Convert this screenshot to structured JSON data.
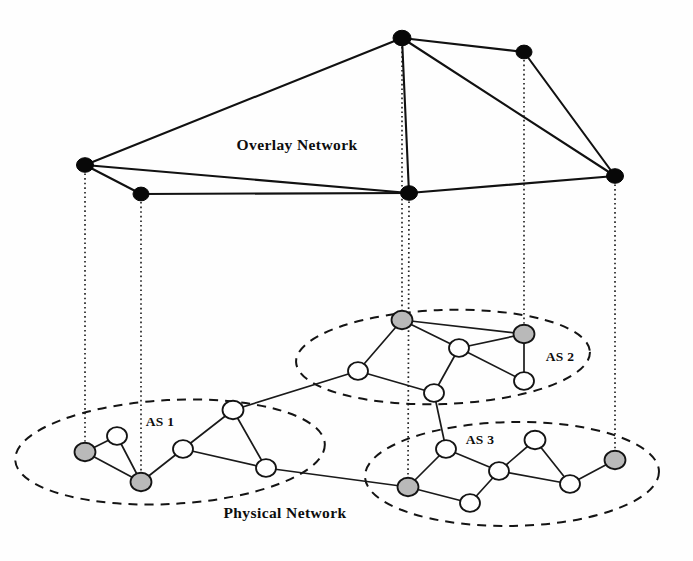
{
  "figure": {
    "labels": {
      "overlay": "Overlay Network",
      "physical": "Physical Network",
      "as1": "AS 1",
      "as2": "AS 2",
      "as3": "AS 3"
    },
    "colors": {
      "overlay_node_fill": "#080808",
      "physical_node_fill": "#ffffff",
      "gateway_node_fill": "#b9b9b9",
      "stroke": "#141414",
      "background": "#ffffff"
    }
  },
  "chart_data": {
    "type": "diagram",
    "layers": [
      {
        "name": "Overlay Network",
        "label_pos": {
          "x": 297,
          "y": 150
        },
        "nodes": [
          {
            "id": "o1",
            "x": 85,
            "y": 165,
            "r": 8.5,
            "style": "filled"
          },
          {
            "id": "o2",
            "x": 141,
            "y": 194,
            "r": 8.0,
            "style": "filled"
          },
          {
            "id": "o3",
            "x": 402,
            "y": 38,
            "r": 9.0,
            "style": "filled"
          },
          {
            "id": "o4",
            "x": 524,
            "y": 52,
            "r": 8.0,
            "style": "filled"
          },
          {
            "id": "o5",
            "x": 409,
            "y": 193,
            "r": 8.5,
            "style": "filled"
          },
          {
            "id": "o6",
            "x": 615,
            "y": 176,
            "r": 8.5,
            "style": "filled"
          }
        ],
        "edges": [
          [
            "o1",
            "o3"
          ],
          [
            "o1",
            "o2"
          ],
          [
            "o1",
            "o5"
          ],
          [
            "o3",
            "o4"
          ],
          [
            "o3",
            "o5"
          ],
          [
            "o3",
            "o6"
          ],
          [
            "o4",
            "o6"
          ],
          [
            "o5",
            "o6"
          ],
          [
            "o2",
            "o5"
          ]
        ]
      },
      {
        "name": "Physical Network",
        "label_pos": {
          "x": 285,
          "y": 518
        },
        "groups": [
          {
            "name": "AS 1",
            "label_pos": {
              "x": 160,
              "y": 426
            },
            "ellipse": {
              "cx": 170,
              "cy": 452,
              "rx": 155,
              "ry": 52,
              "rotate": -3
            },
            "nodes": [
              {
                "id": "p1",
                "x": 85,
                "y": 452,
                "r": 10.5,
                "style": "gateway"
              },
              {
                "id": "p2",
                "x": 117,
                "y": 436,
                "r": 10.0,
                "style": "host"
              },
              {
                "id": "p3",
                "x": 141,
                "y": 482,
                "r": 10.5,
                "style": "gateway"
              },
              {
                "id": "p4",
                "x": 183,
                "y": 449,
                "r": 10.0,
                "style": "host"
              },
              {
                "id": "p5",
                "x": 233,
                "y": 410,
                "r": 10.5,
                "style": "host"
              },
              {
                "id": "p6",
                "x": 266,
                "y": 468,
                "r": 10.0,
                "style": "host"
              }
            ],
            "edges": [
              [
                "p1",
                "p2"
              ],
              [
                "p1",
                "p3"
              ],
              [
                "p2",
                "p3"
              ],
              [
                "p3",
                "p4"
              ],
              [
                "p4",
                "p5"
              ],
              [
                "p4",
                "p6"
              ],
              [
                "p5",
                "p6"
              ]
            ]
          },
          {
            "name": "AS 2",
            "label_pos": {
              "x": 560,
              "y": 361
            },
            "ellipse": {
              "cx": 443,
              "cy": 357,
              "rx": 147,
              "ry": 47,
              "rotate": -2
            },
            "nodes": [
              {
                "id": "q1",
                "x": 402,
                "y": 320,
                "r": 10.5,
                "style": "gateway"
              },
              {
                "id": "q2",
                "x": 524,
                "y": 334,
                "r": 10.5,
                "style": "gateway"
              },
              {
                "id": "q3",
                "x": 459,
                "y": 348,
                "r": 10.0,
                "style": "host"
              },
              {
                "id": "q4",
                "x": 358,
                "y": 371,
                "r": 10.0,
                "style": "host"
              },
              {
                "id": "q5",
                "x": 434,
                "y": 393,
                "r": 10.0,
                "style": "host"
              },
              {
                "id": "q6",
                "x": 524,
                "y": 381,
                "r": 10.0,
                "style": "host"
              }
            ],
            "edges": [
              [
                "q1",
                "q2"
              ],
              [
                "q1",
                "q3"
              ],
              [
                "q1",
                "q4"
              ],
              [
                "q2",
                "q3"
              ],
              [
                "q2",
                "q6"
              ],
              [
                "q3",
                "q5"
              ],
              [
                "q3",
                "q6"
              ],
              [
                "q4",
                "q5"
              ]
            ]
          },
          {
            "name": "AS 3",
            "label_pos": {
              "x": 480,
              "y": 444
            },
            "ellipse": {
              "cx": 512,
              "cy": 474,
              "rx": 147,
              "ry": 52,
              "rotate": -1
            },
            "nodes": [
              {
                "id": "r1",
                "x": 446,
                "y": 449,
                "r": 10.0,
                "style": "host"
              },
              {
                "id": "r2",
                "x": 408,
                "y": 487,
                "r": 10.5,
                "style": "gateway"
              },
              {
                "id": "r3",
                "x": 499,
                "y": 471,
                "r": 10.0,
                "style": "host"
              },
              {
                "id": "r4",
                "x": 535,
                "y": 440,
                "r": 10.5,
                "style": "host"
              },
              {
                "id": "r5",
                "x": 470,
                "y": 503,
                "r": 10.0,
                "style": "host"
              },
              {
                "id": "r6",
                "x": 570,
                "y": 484,
                "r": 10.0,
                "style": "host"
              },
              {
                "id": "r7",
                "x": 615,
                "y": 460,
                "r": 10.5,
                "style": "gateway"
              }
            ],
            "edges": [
              [
                "r1",
                "r2"
              ],
              [
                "r1",
                "r3"
              ],
              [
                "r2",
                "r5"
              ],
              [
                "r3",
                "r4"
              ],
              [
                "r3",
                "r5"
              ],
              [
                "r3",
                "r6"
              ],
              [
                "r4",
                "r6"
              ],
              [
                "r6",
                "r7"
              ]
            ]
          }
        ],
        "inter_as_edges": [
          [
            "p5",
            "q4"
          ],
          [
            "p6",
            "r2"
          ],
          [
            "q5",
            "r1"
          ]
        ]
      }
    ],
    "mappings": [
      {
        "overlay": "o1",
        "physical": "p1",
        "x": 85
      },
      {
        "overlay": "o2",
        "physical": "p3",
        "x": 141
      },
      {
        "overlay": "o3",
        "physical": "q1",
        "x": 402
      },
      {
        "overlay": "o5",
        "physical": "r2",
        "x": 409
      },
      {
        "overlay": "o4",
        "physical": "q2",
        "x": 524
      },
      {
        "overlay": "o6",
        "physical": "r7",
        "x": 615
      }
    ]
  }
}
